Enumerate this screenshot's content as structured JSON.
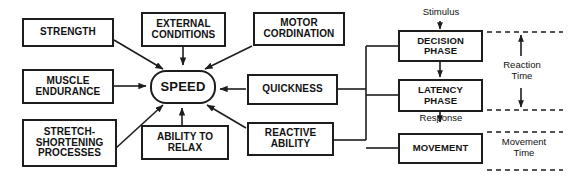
{
  "diagram": {
    "style": {
      "box_border": "#1d1d1d",
      "background": "#ffffff",
      "text": "#111111"
    },
    "determinant_nodes": [
      {
        "id": "strength",
        "label": "STRENGTH"
      },
      {
        "id": "external",
        "label": "EXTERNAL\nCONDITIONS"
      },
      {
        "id": "motor",
        "label": "MOTOR\nCORDINATION"
      },
      {
        "id": "endurance",
        "label": "MUSCLE\nENDURANCE"
      },
      {
        "id": "stretch",
        "label": "STRETCH-\nSHORTENING\nPROCESSES"
      },
      {
        "id": "relax",
        "label": "ABILITY TO\nRELAX"
      },
      {
        "id": "quickness",
        "label": "QUICKNESS"
      },
      {
        "id": "reactive",
        "label": "REACTIVE\nABILITY"
      }
    ],
    "center_node": {
      "id": "speed",
      "label": "SPEED"
    },
    "phase_nodes": [
      {
        "id": "decision",
        "label": "DECISION\nPHASE"
      },
      {
        "id": "latency",
        "label": "LATENCY\nPHASE"
      },
      {
        "id": "movement",
        "label": "MOVEMENT"
      }
    ],
    "flow_labels": [
      {
        "id": "stimulus",
        "label": "Stimulus"
      },
      {
        "id": "response",
        "label": "Response"
      }
    ],
    "time_brackets": [
      {
        "id": "reaction-time",
        "label": "Reaction\nTime"
      },
      {
        "id": "movement-time",
        "label": "Movement\nTime"
      }
    ]
  }
}
